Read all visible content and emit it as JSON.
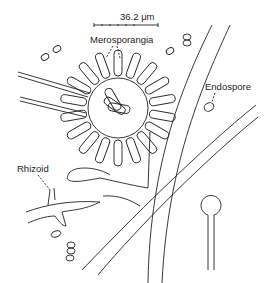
{
  "figure": {
    "scale_bar": {
      "label": "36.2 μm",
      "value": 36.2,
      "unit": "μm"
    },
    "labels": {
      "merosporangia": "Merosporangia",
      "endospore": "Endospore",
      "rhizoid": "Rhizoid"
    },
    "colors": {
      "line": "#222222",
      "background": "#ffffff"
    }
  }
}
